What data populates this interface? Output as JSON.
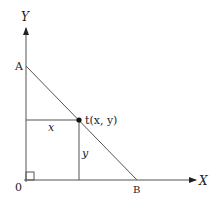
{
  "diagram": {
    "axes": {
      "x_label": "X",
      "y_label": "Y",
      "origin_label": "0"
    },
    "points": {
      "A": {
        "label": "A",
        "x": 26,
        "y": 66
      },
      "B": {
        "label": "B",
        "x": 137,
        "y": 180
      },
      "t": {
        "label": "t(x, y)",
        "x": 79,
        "y": 120
      }
    },
    "segment_labels": {
      "horizontal": "x",
      "vertical": "y"
    },
    "colors": {
      "line": "#555555",
      "text": "#222222",
      "point": "#111111"
    }
  }
}
